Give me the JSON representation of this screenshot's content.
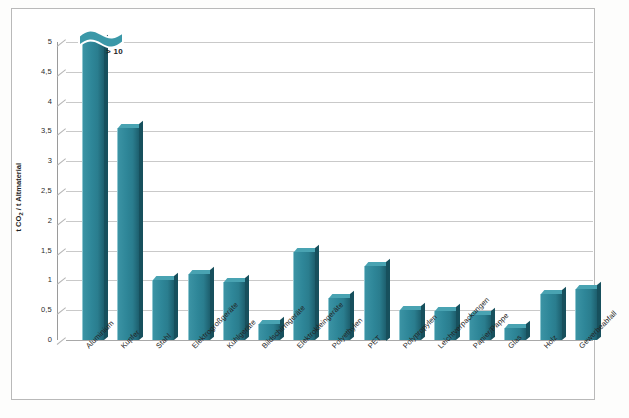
{
  "chart_data": {
    "type": "bar",
    "title": "",
    "xlabel": "",
    "ylabel": "t CO2 / t Altmaterial",
    "ylim": [
      0,
      5
    ],
    "ytick_labels": [
      "5",
      "4,5",
      "4",
      "3,5",
      "3",
      "2,5",
      "2",
      "1,5",
      "1",
      "0,5",
      "0"
    ],
    "ytick_values": [
      5,
      4.5,
      4,
      3.5,
      3,
      2.5,
      2,
      1.5,
      1,
      0.5,
      0
    ],
    "grid": true,
    "legend": "none",
    "axis_break": true,
    "categories": [
      "Aluminium",
      "Kupfer",
      "Stahl",
      "Elektrogroßgeräte",
      "Kühlgeräte",
      "Bildschirmgeräte",
      "Elektrokleingeräte",
      "Polyethylen",
      "PET",
      "Polypropylen",
      "Leichtverpackungen",
      "Papier/Pappe",
      "Glas",
      "Holz",
      "Gewerbeabfall"
    ],
    "values": [
      5.0,
      3.55,
      1.0,
      1.1,
      0.97,
      0.27,
      1.47,
      0.7,
      1.25,
      0.5,
      0.48,
      0.42,
      0.2,
      0.78,
      0.85
    ],
    "annotations": [
      {
        "text": "> 10",
        "category": "Aluminium",
        "note": "Aluminium bar exceeds the axis; drawn with a broken-axis cap"
      }
    ],
    "colors": {
      "bar_face": "#2e8698",
      "bar_top": "#49a3b2",
      "bar_side": "#17505d",
      "gridline": "#c9c9c9",
      "axis": "#9a9a9a",
      "frame": "#b9b9b9",
      "background": "#ffffff",
      "text": "#242424"
    }
  }
}
